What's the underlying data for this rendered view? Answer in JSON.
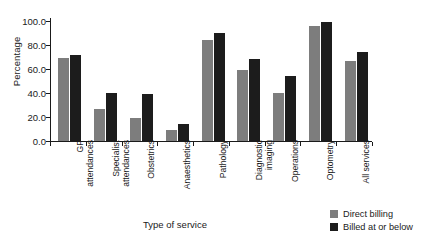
{
  "chart_data": {
    "type": "bar",
    "title": "",
    "xlabel": "Type of service",
    "ylabel": "Percentage",
    "ylim": [
      0,
      100
    ],
    "yticks": [
      "0.0",
      "20.0",
      "40.0",
      "60.0",
      "80.0",
      "100.0"
    ],
    "ytick_values": [
      0,
      20,
      40,
      60,
      80,
      100
    ],
    "grid": false,
    "legend_position": "bottom-right",
    "categories": [
      "GP attendances",
      "Specialist attendances",
      "Obstetrics",
      "Anaesthetics",
      "Pathology",
      "Diagnostic imaging",
      "Operations",
      "Optometry",
      "All services"
    ],
    "category_lines": [
      [
        "GP",
        "attendances"
      ],
      [
        "Specialist",
        "attendances"
      ],
      [
        "Obstetrics",
        ""
      ],
      [
        "Anaesthetics",
        ""
      ],
      [
        "Pathology",
        ""
      ],
      [
        "Diagnostic",
        "imaging"
      ],
      [
        "Operations",
        ""
      ],
      [
        "Optometry",
        ""
      ],
      [
        "All services",
        ""
      ]
    ],
    "series": [
      {
        "name": "Direct billing",
        "color": "#7d7d7d",
        "values": [
          69,
          27,
          19,
          9,
          84,
          59,
          40,
          96,
          67
        ]
      },
      {
        "name": "Billed at or below",
        "color": "#1c1c1c",
        "values": [
          72,
          40,
          39,
          14,
          90,
          68,
          54,
          99,
          74
        ]
      }
    ]
  },
  "legend": {
    "items": [
      {
        "label": "Direct billing",
        "color": "#7d7d7d"
      },
      {
        "label": "Billed at or below",
        "color": "#1c1c1c"
      }
    ]
  }
}
